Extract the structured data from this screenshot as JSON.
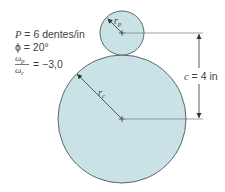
{
  "parameters": {
    "pitch": {
      "symbol": "P",
      "eq": " = 6 dentes/in"
    },
    "pressure_angle": {
      "symbol": "ϕ",
      "eq": " = 20°"
    },
    "ratio": {
      "numerator": "ω",
      "numerator_sub": "p",
      "denominator": "ω",
      "denominator_sub": "c",
      "eq": "= −3,0"
    }
  },
  "pinion": {
    "label": "r",
    "label_sub": "p",
    "cx": 122,
    "cy": 33,
    "r": 22
  },
  "gear": {
    "label": "r",
    "label_sub": "c",
    "cx": 122,
    "cy": 119,
    "r": 64
  },
  "center_distance": {
    "symbol": "c",
    "eq": " = 4 in"
  },
  "colors": {
    "fill": "#c8e2e5",
    "stroke": "#5b6668",
    "line": "#777777",
    "text": "#3f3f3f"
  }
}
